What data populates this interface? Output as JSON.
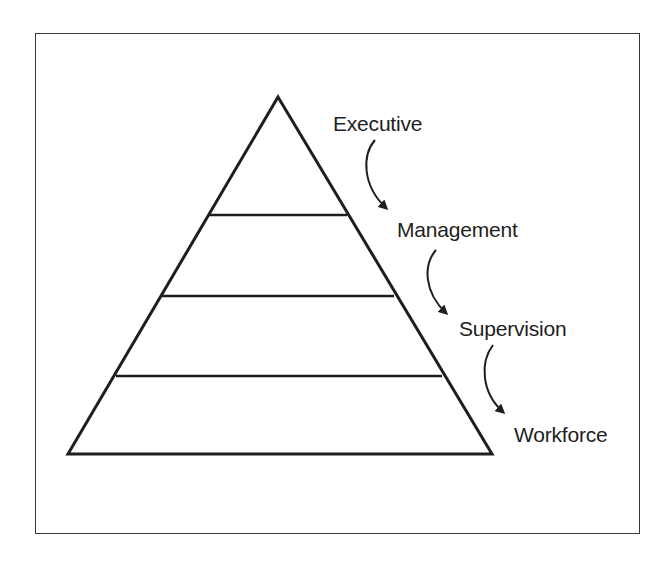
{
  "figure": {
    "type": "pyramid-hierarchy",
    "stroke_color": "#1e1e1e",
    "frame_color": "#3a3a3a",
    "levels": [
      {
        "label": "Executive"
      },
      {
        "label": "Management"
      },
      {
        "label": "Supervision"
      },
      {
        "label": "Workforce"
      }
    ],
    "flow_direction": "top-to-bottom"
  }
}
